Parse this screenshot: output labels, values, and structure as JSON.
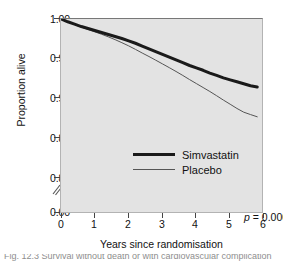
{
  "figure": {
    "background_color": "#ffffff",
    "plot_background_color": "#e3e3e3",
    "caption_partial": "Fig. 12.3   Survival without death or with cardiovascular complication"
  },
  "chart_data": {
    "type": "line",
    "title": "",
    "subtitle": "",
    "xlabel": "Years since randomisation",
    "ylabel": "Proportion alive",
    "xlim": [
      0,
      6
    ],
    "ylim": [
      0.78,
      1.0
    ],
    "grid": false,
    "legend_position": "inside-center-left",
    "xticks": [
      "0",
      "1",
      "2",
      "3",
      "4",
      "5",
      "6"
    ],
    "xtick_values": [
      0,
      1,
      2,
      3,
      4,
      5,
      6
    ],
    "yticks": [
      "1.00",
      "0.95",
      "0.90",
      "0.85",
      "0.80",
      "0.00"
    ],
    "ytick_values": [
      1.0,
      0.95,
      0.9,
      0.85,
      0.8,
      0.0
    ],
    "axis_break": true,
    "axis_break_between": [
      0.8,
      0.0
    ],
    "annotations": [
      {
        "name": "p-value",
        "text_prefix": "p",
        "text_suffix": " = 0.0003",
        "x": 4.7,
        "y": 0.806
      }
    ],
    "series": [
      {
        "name": "Simvastatin",
        "color": "#1a1a1a",
        "line_width": 3,
        "x": [
          0,
          0.2,
          0.4,
          0.6,
          0.8,
          1.0,
          1.2,
          1.4,
          1.6,
          1.8,
          2.0,
          2.2,
          2.4,
          2.6,
          2.8,
          3.0,
          3.2,
          3.4,
          3.6,
          3.8,
          4.0,
          4.2,
          4.4,
          4.6,
          4.8,
          5.0,
          5.2,
          5.4,
          5.6,
          5.8
        ],
        "values": [
          1.0,
          0.9965,
          0.9935,
          0.9905,
          0.988,
          0.9855,
          0.983,
          0.9805,
          0.978,
          0.9755,
          0.9725,
          0.9695,
          0.966,
          0.9625,
          0.959,
          0.9555,
          0.952,
          0.9485,
          0.945,
          0.9415,
          0.9385,
          0.9355,
          0.932,
          0.929,
          0.926,
          0.9235,
          0.921,
          0.9185,
          0.916,
          0.9145
        ]
      },
      {
        "name": "Placebo",
        "color": "#555555",
        "line_width": 1,
        "x": [
          0,
          0.2,
          0.4,
          0.6,
          0.8,
          1.0,
          1.2,
          1.4,
          1.6,
          1.8,
          2.0,
          2.2,
          2.4,
          2.6,
          2.8,
          3.0,
          3.2,
          3.4,
          3.6,
          3.8,
          4.0,
          4.2,
          4.4,
          4.6,
          4.8,
          5.0,
          5.2,
          5.4,
          5.6,
          5.8
        ],
        "values": [
          1.0,
          0.9962,
          0.993,
          0.9898,
          0.9868,
          0.9838,
          0.9808,
          0.9775,
          0.974,
          0.9702,
          0.9662,
          0.9618,
          0.9572,
          0.9528,
          0.9482,
          0.9435,
          0.9388,
          0.934,
          0.929,
          0.9238,
          0.9188,
          0.9138,
          0.9088,
          0.9035,
          0.898,
          0.8928,
          0.8875,
          0.8828,
          0.8798,
          0.877
        ]
      }
    ]
  },
  "legend": {
    "items": [
      {
        "label": "Simvastatin",
        "style": "thick"
      },
      {
        "label": "Placebo",
        "style": "thin"
      }
    ]
  }
}
